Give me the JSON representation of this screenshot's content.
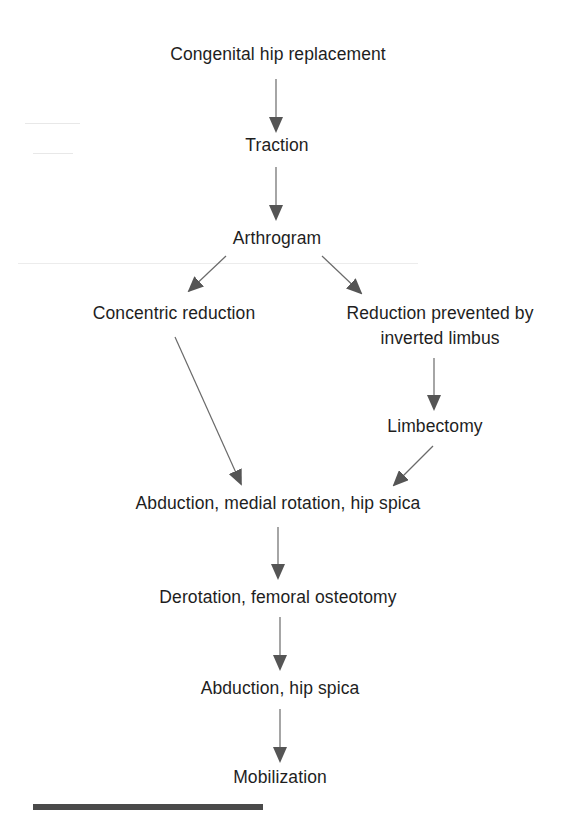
{
  "diagram": {
    "type": "flowchart",
    "direction": "top-to-bottom",
    "nodes": {
      "congenital": {
        "label": "Congenital hip replacement"
      },
      "traction": {
        "label": "Traction"
      },
      "arthrogram": {
        "label": "Arthrogram"
      },
      "concentric": {
        "label": "Concentric reduction"
      },
      "prevented_line1": {
        "label": "Reduction prevented by"
      },
      "prevented_line2": {
        "label": "inverted limbus"
      },
      "limbectomy": {
        "label": "Limbectomy"
      },
      "abduction_medial": {
        "label": "Abduction, medial rotation, hip spica"
      },
      "derotation": {
        "label": "Derotation, femoral osteotomy"
      },
      "abduction_spica": {
        "label": "Abduction, hip spica"
      },
      "mobilization": {
        "label": "Mobilization"
      }
    },
    "edges": [
      {
        "from": "Congenital hip replacement",
        "to": "Traction"
      },
      {
        "from": "Traction",
        "to": "Arthrogram"
      },
      {
        "from": "Arthrogram",
        "to": "Concentric reduction"
      },
      {
        "from": "Arthrogram",
        "to": "Reduction prevented by inverted limbus"
      },
      {
        "from": "Reduction prevented by inverted limbus",
        "to": "Limbectomy"
      },
      {
        "from": "Concentric reduction",
        "to": "Abduction, medial rotation, hip spica"
      },
      {
        "from": "Limbectomy",
        "to": "Abduction, medial rotation, hip spica"
      },
      {
        "from": "Abduction, medial rotation, hip spica",
        "to": "Derotation, femoral osteotomy"
      },
      {
        "from": "Derotation, femoral osteotomy",
        "to": "Abduction, hip spica"
      },
      {
        "from": "Abduction, hip spica",
        "to": "Mobilization"
      }
    ],
    "colors": {
      "text": "#1e1e1e",
      "arrow": "#555555",
      "footer_bar": "#4a4a4a"
    }
  }
}
